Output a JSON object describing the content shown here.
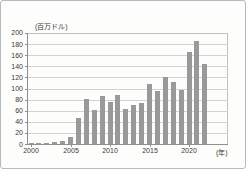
{
  "figure": {
    "y_axis_title": "(百万ドル)",
    "x_axis_unit": "(年)"
  },
  "chart_data": {
    "type": "bar",
    "title": "",
    "ylabel": "(百万ドル)",
    "xlabel": "(年)",
    "ylim": [
      0,
      200
    ],
    "ytick_step": 20,
    "yticks": [
      0,
      20,
      40,
      60,
      80,
      100,
      120,
      140,
      160,
      180,
      200
    ],
    "xtick_labels": [
      "2000",
      "2005",
      "2010",
      "2015",
      "2020"
    ],
    "xtick_years": [
      2000,
      2005,
      2010,
      2015,
      2020
    ],
    "categories": [
      2000,
      2001,
      2002,
      2003,
      2004,
      2005,
      2006,
      2007,
      2008,
      2009,
      2010,
      2011,
      2012,
      2013,
      2014,
      2015,
      2016,
      2017,
      2018,
      2019,
      2020,
      2021,
      2022
    ],
    "values": [
      1,
      1,
      2,
      3,
      5,
      12,
      47,
      81,
      61,
      87,
      76,
      89,
      63,
      70,
      73,
      109,
      95,
      121,
      112,
      98,
      166,
      185,
      144
    ],
    "grid": true,
    "legend": false,
    "bar_color": "#999999",
    "gridline_color": "#d2d2d2",
    "axis_color": "#8f8f8f",
    "text_color": "#3a3a3a"
  }
}
